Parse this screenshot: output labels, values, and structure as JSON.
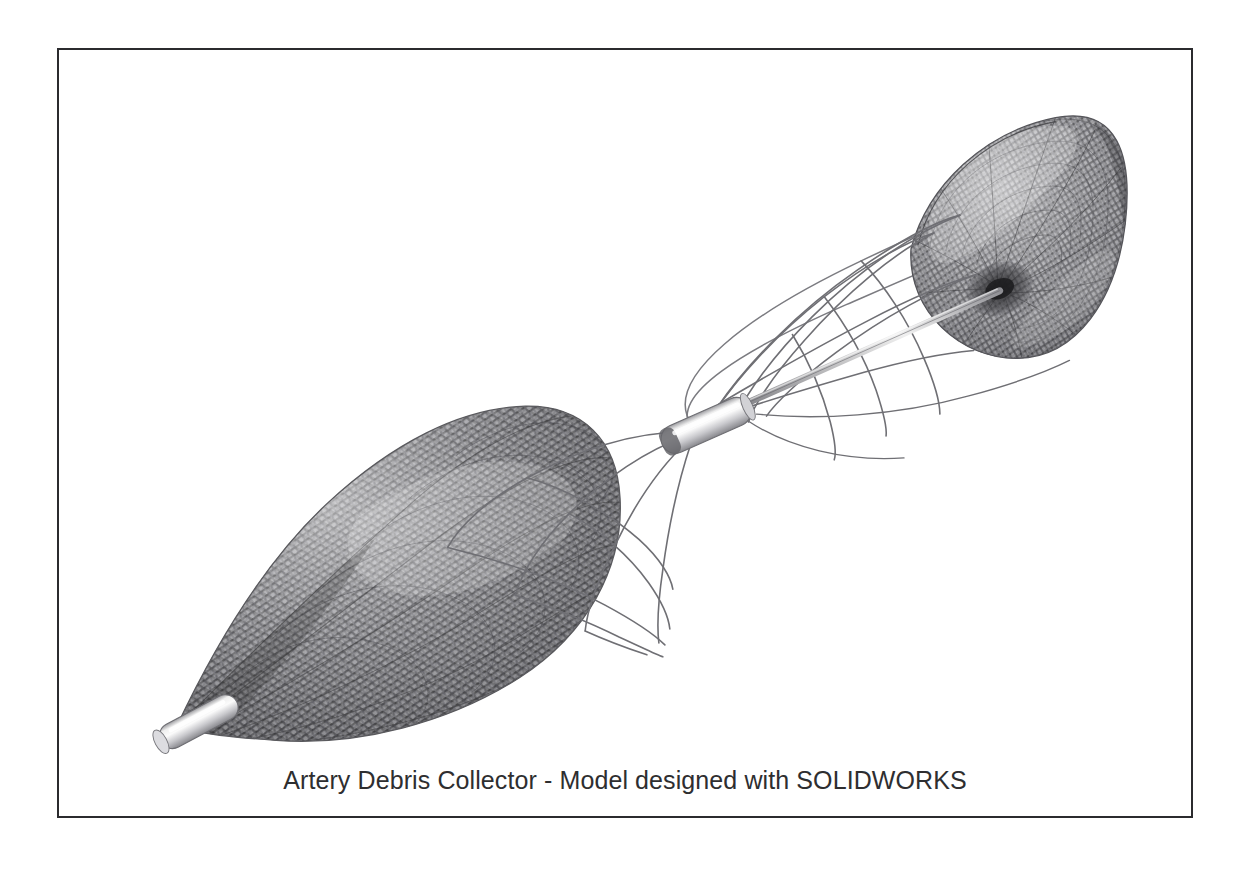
{
  "figure": {
    "caption": "Artery Debris Collector - Model designed with SOLIDWORKS",
    "frame": {
      "border_color": "#2b2b2e",
      "background_color": "#ffffff",
      "border_width_px": 2
    },
    "device_name": "Artery Debris Collector",
    "cad_software": "SOLIDWORKS",
    "render_style": "grayscale wireframe / woven mesh CAD render",
    "colors": {
      "mesh_dark": "#4a4a4c",
      "mesh_mid": "#7d7d80",
      "mesh_light": "#b9b9bc",
      "wire_stroke": "#6f6f73",
      "metal_highlight": "#f2f2f2",
      "metal_shadow": "#8e8e92",
      "caption_text": "#2e2e30"
    },
    "components": [
      {
        "name": "distal-mesh-basket",
        "label": "Teardrop debris capture basket",
        "shape": "teardrop / bulb woven mesh",
        "position": "lower-left"
      },
      {
        "name": "proximal-mesh-funnel",
        "label": "Funnel collection bell",
        "shape": "flared cone / trumpet bell woven mesh",
        "position": "upper-right"
      },
      {
        "name": "central-hub-sleeve",
        "label": "Central cylindrical hub sleeve",
        "shape": "cylinder",
        "position": "center"
      },
      {
        "name": "distal-tip",
        "label": "Rounded atraumatic distal tip",
        "shape": "capsule",
        "position": "bottom-left"
      },
      {
        "name": "strut-wires",
        "label": "Nitinol strut wires",
        "shape": "curved strands",
        "position": "between hub and baskets"
      },
      {
        "name": "guide-shaft",
        "label": "Guide shaft",
        "shape": "thin rod",
        "position": "hub to funnel apex"
      }
    ]
  }
}
